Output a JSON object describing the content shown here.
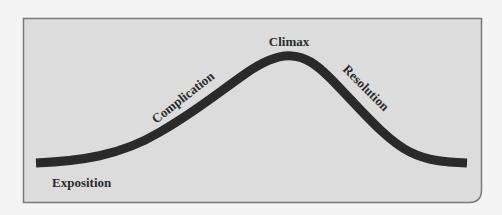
{
  "diagram": {
    "type": "plot-structure-arc",
    "frame": {
      "fill": "#dcdcdc",
      "border": "#7a7a7a",
      "page_background": "#f4f4f4"
    },
    "curve": {
      "color": "#2a2a2a",
      "stroke_width": 9
    },
    "stages": [
      {
        "id": "exposition",
        "label": "Exposition"
      },
      {
        "id": "complication",
        "label": "Complication"
      },
      {
        "id": "climax",
        "label": "Climax"
      },
      {
        "id": "resolution",
        "label": "Resolution"
      }
    ]
  }
}
